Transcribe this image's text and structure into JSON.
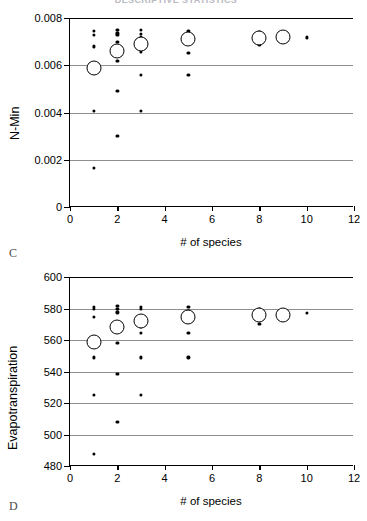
{
  "figure": {
    "cutoff_title": "DESCRIPTIVE STATISTICS",
    "panels": [
      {
        "letter": "C"
      },
      {
        "letter": "D"
      }
    ]
  },
  "chart_data": [
    {
      "id": "panel-c",
      "type": "scatter",
      "title": "",
      "panel_label": "C",
      "xlabel": "# of species",
      "ylabel": "N-Min",
      "xlim": [
        0,
        12
      ],
      "ylim": [
        0,
        0.008
      ],
      "xticks": [
        0,
        2,
        4,
        6,
        8,
        10,
        12
      ],
      "xticklabels": [
        "0",
        "2",
        "4",
        "6",
        "8",
        "10",
        "12"
      ],
      "yticks": [
        0,
        0.002,
        0.004,
        0.006,
        0.008
      ],
      "yticklabels": [
        "0",
        "0.002",
        "0.004",
        "0.006",
        "0.008"
      ],
      "grid": "horizontal",
      "legend": "none",
      "series": [
        {
          "name": "individual replicates",
          "marker": "small-filled-circle",
          "points": [
            {
              "x": 1,
              "y": 0.00745
            },
            {
              "x": 1,
              "y": 0.00728
            },
            {
              "x": 1,
              "y": 0.0068
            },
            {
              "x": 1,
              "y": 0.00572
            },
            {
              "x": 1,
              "y": 0.00407
            },
            {
              "x": 1,
              "y": 0.00166
            },
            {
              "x": 2,
              "y": 0.00748
            },
            {
              "x": 2,
              "y": 0.00735
            },
            {
              "x": 2,
              "y": 0.00728
            },
            {
              "x": 2,
              "y": 0.007
            },
            {
              "x": 2,
              "y": 0.00617
            },
            {
              "x": 2,
              "y": 0.0049
            },
            {
              "x": 2,
              "y": 0.003
            },
            {
              "x": 3,
              "y": 0.00748
            },
            {
              "x": 3,
              "y": 0.00733
            },
            {
              "x": 3,
              "y": 0.0072
            },
            {
              "x": 3,
              "y": 0.00655
            },
            {
              "x": 3,
              "y": 0.0056
            },
            {
              "x": 3,
              "y": 0.00408
            },
            {
              "x": 5,
              "y": 0.00745
            },
            {
              "x": 5,
              "y": 0.00728
            },
            {
              "x": 5,
              "y": 0.00653
            },
            {
              "x": 5,
              "y": 0.00558
            },
            {
              "x": 8,
              "y": 0.0074
            },
            {
              "x": 8,
              "y": 0.00688
            },
            {
              "x": 10,
              "y": 0.00718
            }
          ]
        },
        {
          "name": "mean",
          "marker": "large-open-circle",
          "points": [
            {
              "x": 1,
              "y": 0.0059
            },
            {
              "x": 2,
              "y": 0.0066
            },
            {
              "x": 3,
              "y": 0.00688
            },
            {
              "x": 5,
              "y": 0.0071
            },
            {
              "x": 8,
              "y": 0.00715
            },
            {
              "x": 9,
              "y": 0.00718
            }
          ]
        }
      ]
    },
    {
      "id": "panel-d",
      "type": "scatter",
      "title": "",
      "panel_label": "D",
      "xlabel": "# of species",
      "ylabel": "Evapotranspiration",
      "xlim": [
        0,
        12
      ],
      "ylim": [
        480,
        600
      ],
      "xticks": [
        0,
        2,
        4,
        6,
        8,
        10,
        12
      ],
      "xticklabels": [
        "0",
        "2",
        "4",
        "6",
        "8",
        "10",
        "12"
      ],
      "yticks": [
        480,
        500,
        520,
        540,
        560,
        580,
        600
      ],
      "yticklabels": [
        "480",
        "500",
        "520",
        "540",
        "560",
        "580",
        "600"
      ],
      "grid": "horizontal",
      "legend": "none",
      "series": [
        {
          "name": "individual replicates",
          "marker": "small-filled-circle",
          "points": [
            {
              "x": 1,
              "y": 581
            },
            {
              "x": 1,
              "y": 579.5
            },
            {
              "x": 1,
              "y": 574.5
            },
            {
              "x": 1,
              "y": 549
            },
            {
              "x": 1,
              "y": 525
            },
            {
              "x": 1,
              "y": 487.5
            },
            {
              "x": 2,
              "y": 581.5
            },
            {
              "x": 2,
              "y": 580
            },
            {
              "x": 2,
              "y": 577.5
            },
            {
              "x": 2,
              "y": 558
            },
            {
              "x": 2,
              "y": 538.5
            },
            {
              "x": 2,
              "y": 508
            },
            {
              "x": 3,
              "y": 581
            },
            {
              "x": 3,
              "y": 579.5
            },
            {
              "x": 3,
              "y": 568.5
            },
            {
              "x": 3,
              "y": 564.5
            },
            {
              "x": 3,
              "y": 549
            },
            {
              "x": 3,
              "y": 525
            },
            {
              "x": 5,
              "y": 581
            },
            {
              "x": 5,
              "y": 578.5
            },
            {
              "x": 5,
              "y": 564.5
            },
            {
              "x": 5,
              "y": 549
            },
            {
              "x": 8,
              "y": 579.5
            },
            {
              "x": 8,
              "y": 570
            },
            {
              "x": 10,
              "y": 577
            }
          ]
        },
        {
          "name": "mean",
          "marker": "large-open-circle",
          "points": [
            {
              "x": 1,
              "y": 559
            },
            {
              "x": 2,
              "y": 568.5
            },
            {
              "x": 3,
              "y": 572
            },
            {
              "x": 5,
              "y": 574.5
            },
            {
              "x": 8,
              "y": 576
            },
            {
              "x": 9,
              "y": 576
            }
          ]
        }
      ]
    }
  ]
}
